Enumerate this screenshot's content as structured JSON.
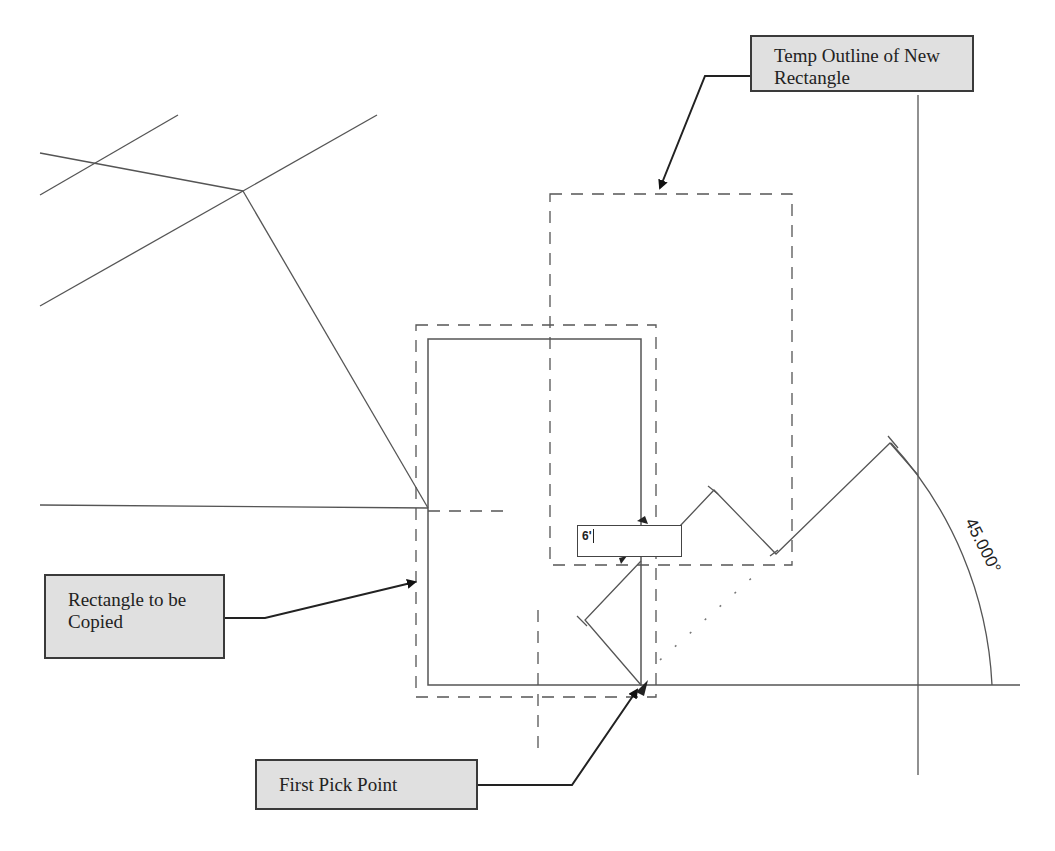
{
  "callouts": {
    "temp_outline": "Temp Outline of New Rectangle",
    "rectangle_to_copy": "Rectangle to be Copied",
    "first_pick_point": "First Pick Point"
  },
  "dimension_input": {
    "value": "6'"
  },
  "angle_label": "45.000°",
  "colors": {
    "line": "#555555",
    "callout_fill": "#e0e0e0",
    "callout_border": "#3a3a3a"
  }
}
